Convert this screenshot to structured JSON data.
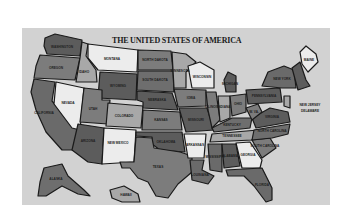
{
  "map": {
    "title": "THE UNITED STATES OF AMERICA",
    "colors": {
      "background": "#d2d2d2",
      "dark": "#5c5c5c",
      "mid": "#7c7c7c",
      "light": "#a8a8a8",
      "white": "#ececec",
      "border": "#1a1a1a"
    },
    "states": {
      "washington": "WASHINGTON",
      "oregon": "OREGON",
      "california": "CALIFORNIA",
      "idaho": "IDAHO",
      "nevada": "NEVADA",
      "montana": "MONTANA",
      "wyoming": "WYOMING",
      "utah": "UTAH",
      "colorado": "COLORADO",
      "arizona": "ARIZONA",
      "new_mexico": "NEW MEXICO",
      "north_dakota": "NORTH DAKOTA",
      "south_dakota": "SOUTH DAKOTA",
      "nebraska": "NEBRASKA",
      "kansas": "KANSAS",
      "oklahoma": "OKLAHOMA",
      "texas": "TEXAS",
      "minnesota": "MINNESOTA",
      "iowa": "IOWA",
      "missouri": "MISSOURI",
      "arkansas": "ARKANSAS",
      "louisiana": "LOUISIANA",
      "wisconsin": "WISCONSIN",
      "illinois": "ILLINOIS",
      "michigan": "MICHIGAN",
      "indiana": "INDIANA",
      "ohio": "OHIO",
      "kentucky": "KENTUCKY",
      "tennessee": "TENNESSEE",
      "mississippi": "MISSISSIPPI",
      "alabama": "ALABAMA",
      "georgia": "GEORGIA",
      "florida": "FLORIDA",
      "south_carolina": "SOUTH CAROLINA",
      "north_carolina": "NORTH CAROLINA",
      "virginia": "VIRGINIA",
      "west_virginia": "W. VA.",
      "pennsylvania": "PENNSYLVANIA",
      "new_york": "NEW YORK",
      "maine": "MAINE",
      "new_jersey": "NEW JERSEY",
      "delaware": "DELAWARE",
      "alaska": "ALASKA",
      "hawaii": "HAWAII"
    }
  }
}
